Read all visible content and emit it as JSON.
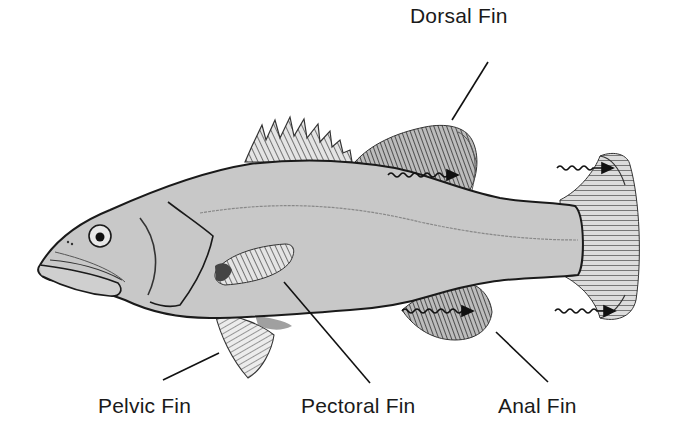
{
  "diagram": {
    "body_color": "#c8c8c8",
    "outline_color": "#1a1a1a",
    "labels": {
      "dorsal": "Dorsal Fin",
      "pelvic": "Pelvic Fin",
      "pectoral": "Pectoral Fin",
      "anal": "Anal Fin"
    },
    "parts": [
      {
        "name": "dorsal-fin",
        "label": "Dorsal Fin"
      },
      {
        "name": "caudal-fin",
        "label": ""
      },
      {
        "name": "anal-fin",
        "label": "Anal Fin"
      },
      {
        "name": "pectoral-fin",
        "label": "Pectoral Fin"
      },
      {
        "name": "pelvic-fin",
        "label": "Pelvic Fin"
      }
    ],
    "motion_arrows": 4
  }
}
